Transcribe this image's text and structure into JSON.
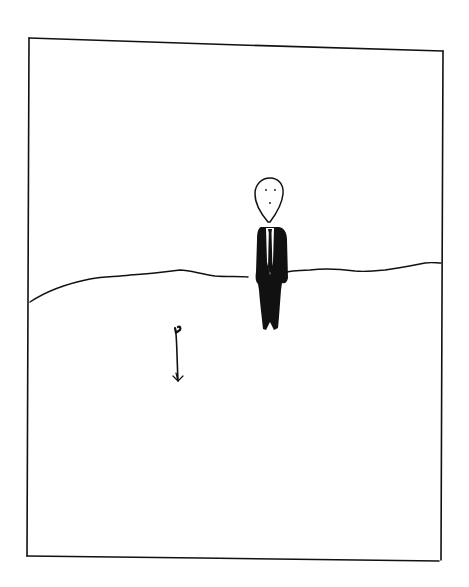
{
  "illustration": {
    "style": "hand-drawn ink sketch",
    "background": "#ffffff",
    "ink": "#111111",
    "elements": [
      {
        "name": "frame",
        "description": "hand-drawn rectangular panel border"
      },
      {
        "name": "horizon",
        "description": "gently rolling hill line across panel"
      },
      {
        "name": "man-in-suit",
        "description": "figure with egg-shaped head, black suit and tie, standing on horizon"
      },
      {
        "name": "sprout",
        "description": "small seedling with two leaves in foreground"
      }
    ]
  }
}
